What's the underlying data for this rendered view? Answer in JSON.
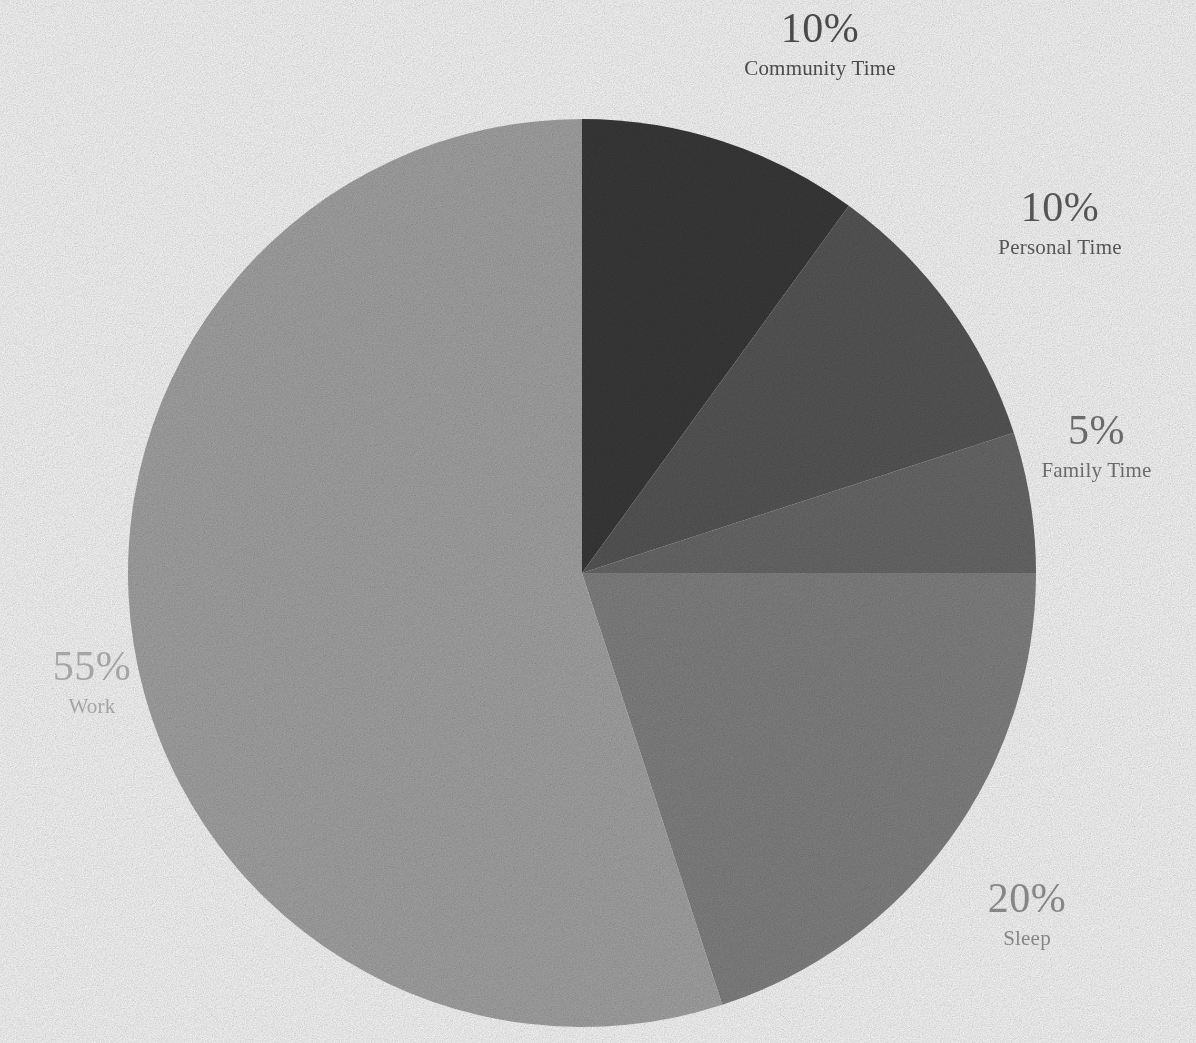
{
  "background_color": "#ffffff",
  "chart_data": {
    "type": "pie",
    "title": "",
    "start_angle_deg": 90,
    "direction": "clockwise",
    "center": {
      "x": 582,
      "y": 573
    },
    "radius": 454,
    "legend": "none",
    "labels_position": "outside",
    "categories": [
      "Community Time",
      "Personal Time",
      "Family Time",
      "Sleep",
      "Work"
    ],
    "values": [
      10,
      10,
      5,
      20,
      55
    ],
    "value_unit": "%",
    "slices": [
      {
        "label": "Community Time",
        "value": 10,
        "percent_text": "10%",
        "color": "#3a3a3a",
        "label_color": "#4a4a4a",
        "start_deg": 0,
        "end_deg": 36
      },
      {
        "label": "Personal Time",
        "value": 10,
        "percent_text": "10%",
        "color": "#585858",
        "label_color": "#555555",
        "start_deg": 36,
        "end_deg": 72
      },
      {
        "label": "Family Time",
        "value": 5,
        "percent_text": "5%",
        "color": "#6b6b6b",
        "label_color": "#6a6a6a",
        "start_deg": 72,
        "end_deg": 90
      },
      {
        "label": "Sleep",
        "value": 20,
        "percent_text": "20%",
        "color": "#858585",
        "label_color": "#868686",
        "start_deg": 90,
        "end_deg": 162
      },
      {
        "label": "Work",
        "value": 55,
        "percent_text": "55%",
        "color": "#a8a8a8",
        "label_color": "#a5a5a5",
        "start_deg": 162,
        "end_deg": 360
      }
    ]
  }
}
